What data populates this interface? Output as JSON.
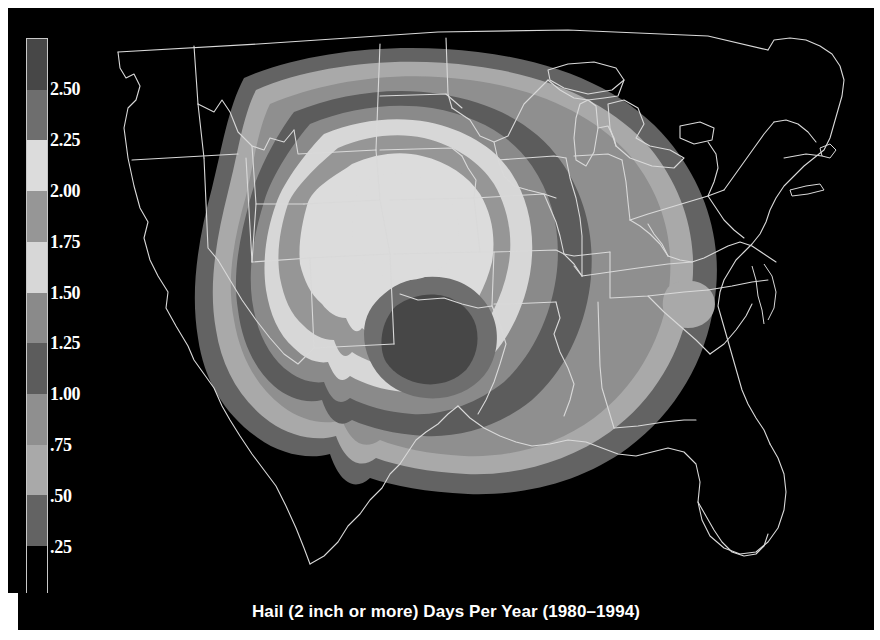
{
  "figure": {
    "title": "Hail (2 inch or more) Days Per Year (1980–1994)",
    "background": "#000000",
    "frame_color": "#ffffff",
    "map_region": "Contiguous United States"
  },
  "colorbar": {
    "orientation": "vertical",
    "label_color": "#ffffff",
    "border_color": "#c8c8c8",
    "tick_labels": [
      "2.50",
      "2.25",
      "2.00",
      "1.75",
      "1.50",
      "1.25",
      "1.00",
      ".75",
      ".50",
      ".25"
    ],
    "tick_values": [
      2.5,
      2.25,
      2.0,
      1.75,
      1.5,
      1.25,
      1.0,
      0.75,
      0.5,
      0.25
    ],
    "bands": [
      {
        "range": "2.50+",
        "color": "#474747"
      },
      {
        "range": "2.25-2.50",
        "color": "#6e6e6e"
      },
      {
        "range": "2.00-2.25",
        "color": "#dcdcdc"
      },
      {
        "range": "1.75-2.00",
        "color": "#969696"
      },
      {
        "range": "1.50-1.75",
        "color": "#d7d7d7"
      },
      {
        "range": "1.25-1.50",
        "color": "#8a8a8a"
      },
      {
        "range": "1.00-1.25",
        "color": "#5c5c5c"
      },
      {
        "range": "0.75-1.00",
        "color": "#8f8f8f"
      },
      {
        "range": "0.50-0.75",
        "color": "#a9a9a9"
      },
      {
        "range": "0.25-0.50",
        "color": "#636363"
      },
      {
        "range": "below 0.25",
        "color": "#000000"
      }
    ]
  },
  "chart_data": {
    "type": "heatmap",
    "title": "Hail (2 inch or more) Days Per Year (1980–1994)",
    "xlabel": "",
    "ylabel": "",
    "variable": "Hail days per year (2 inch diameter or more)",
    "units": "days per year",
    "period": "1980–1994",
    "legend_position": "left",
    "grid": false,
    "colormap": "grayscale-stepped",
    "contour_levels": [
      0.25,
      0.5,
      0.75,
      1.0,
      1.25,
      1.5,
      1.75,
      2.0,
      2.25,
      2.5
    ],
    "zlim": [
      0,
      2.75
    ],
    "max_region": "Southern Great Plains (western Oklahoma / Texas Panhandle)",
    "max_value": 2.75,
    "min_value": 0.0,
    "region_values": [
      {
        "region": "Texas Panhandle / W Oklahoma",
        "value": 2.75
      },
      {
        "region": "Kansas",
        "value": 2.1
      },
      {
        "region": "Nebraska",
        "value": 2.1
      },
      {
        "region": "Missouri",
        "value": 1.4
      },
      {
        "region": "Arkansas",
        "value": 1.25
      },
      {
        "region": "Iowa",
        "value": 1.3
      },
      {
        "region": "Illinois",
        "value": 1.1
      },
      {
        "region": "Tennessee",
        "value": 1.0
      },
      {
        "region": "Virginia / Carolinas",
        "value": 0.85
      },
      {
        "region": "Ohio Valley",
        "value": 0.95
      },
      {
        "region": "Gulf Coast",
        "value": 0.7
      },
      {
        "region": "Great Lakes",
        "value": 0.6
      },
      {
        "region": "Northeast",
        "value": 0.25
      },
      {
        "region": "Florida",
        "value": 0.15
      },
      {
        "region": "Rocky Mountains / West",
        "value": 0.05
      },
      {
        "region": "Pacific Coast",
        "value": 0.0
      }
    ]
  }
}
